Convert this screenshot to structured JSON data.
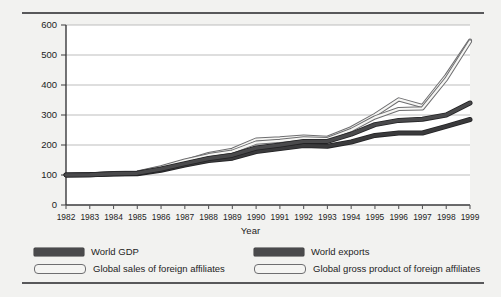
{
  "figure": {
    "background_color": "#f2f2f0",
    "frame_rule_color": "#58585a"
  },
  "chart_data": {
    "type": "line",
    "title": "",
    "subtitle": "",
    "xlabel": "Year",
    "ylabel": "",
    "grid": true,
    "legend_position": "bottom",
    "xlim": [
      1982,
      1999
    ],
    "ylim": [
      0,
      600
    ],
    "yticks": [
      0,
      100,
      200,
      300,
      400,
      500,
      600
    ],
    "ytick_labels": [
      "0",
      "100",
      "200",
      "300",
      "400",
      "500",
      "600"
    ],
    "categories": [
      "1982",
      "1983",
      "1984",
      "1985",
      "1986",
      "1987",
      "1988",
      "1989",
      "1990",
      "1991",
      "1992",
      "1993",
      "1994",
      "1995",
      "1996",
      "1997",
      "1998",
      "1999"
    ],
    "x": [
      1982,
      1983,
      1984,
      1985,
      1986,
      1987,
      1988,
      1989,
      1990,
      1991,
      1992,
      1993,
      1994,
      1995,
      1996,
      1997,
      1998,
      1999
    ],
    "series": [
      {
        "name": "World GDP",
        "style": "thick-dark",
        "color": "#3a3a3c",
        "values": [
          100,
          101,
          103,
          104,
          116,
          133,
          148,
          156,
          178,
          188,
          198,
          196,
          210,
          232,
          240,
          240,
          262,
          285
        ]
      },
      {
        "name": "World exports",
        "style": "thick-dark",
        "color": "#4a4a4c",
        "values": [
          100,
          101,
          104,
          106,
          120,
          138,
          155,
          166,
          190,
          200,
          212,
          212,
          236,
          268,
          282,
          286,
          300,
          340
        ]
      },
      {
        "name": "Global sales of foreign affiliates",
        "style": "hollow-light",
        "color": "#8c8c8e",
        "values": [
          100,
          102,
          105,
          107,
          124,
          146,
          170,
          184,
          218,
          222,
          228,
          224,
          256,
          300,
          352,
          330,
          430,
          548
        ]
      },
      {
        "name": "Global gross product of foreign affiliates",
        "style": "hollow-light",
        "color": "#8c8c8e",
        "values": [
          100,
          102,
          106,
          108,
          126,
          148,
          166,
          178,
          208,
          214,
          222,
          220,
          250,
          292,
          320,
          322,
          420,
          545
        ]
      }
    ]
  },
  "legend": {
    "entries": [
      {
        "label": "World GDP",
        "swatch": "solid"
      },
      {
        "label": "World exports",
        "swatch": "solid"
      },
      {
        "label": "Global sales of foreign affiliates",
        "swatch": "hollow"
      },
      {
        "label": "Global gross product of foreign affiliates",
        "swatch": "hollow"
      }
    ]
  }
}
